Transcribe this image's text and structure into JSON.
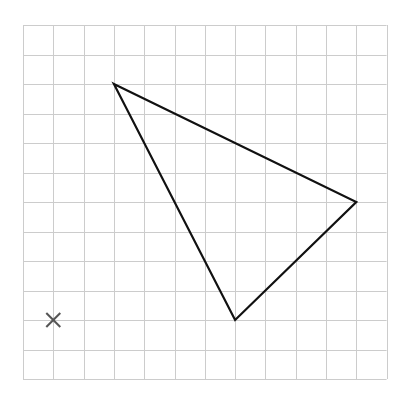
{
  "grid": {
    "columns": 12,
    "rows": 12,
    "origin_px": [
      23,
      25
    ],
    "cell_w": 30.3,
    "cell_h": 29.5,
    "line_color": "#cccccc",
    "line_width": 1
  },
  "triangle": {
    "vertices_grid": [
      [
        3,
        2
      ],
      [
        11,
        6
      ],
      [
        7,
        10
      ]
    ],
    "stroke_color": "#111111",
    "stroke_width": 2.2
  },
  "marker": {
    "type": "cross",
    "position_grid": [
      1,
      10
    ],
    "size_px": 7,
    "color": "#555555",
    "stroke_width": 2
  }
}
